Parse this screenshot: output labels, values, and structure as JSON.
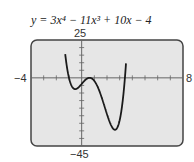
{
  "chart_data": {
    "type": "line",
    "title": "y = 3x⁴ − 11x³ + 10x − 4",
    "function": "3x^4 - 11x^3 + 10x - 4",
    "xlim": [
      -4,
      8
    ],
    "ylim": [
      -45,
      25
    ],
    "xlabel": "",
    "ylabel": "",
    "tick_labels": {
      "xmin": "−4",
      "xmax": "8",
      "ymax": "25",
      "ymin": "−45"
    },
    "x_tick_step": 1,
    "y_tick_step": 5,
    "grid": false,
    "series": [
      {
        "name": "y = 3x⁴ − 11x³ + 10x − 4",
        "x": [
          -1.0,
          -0.75,
          -0.5,
          -0.25,
          0,
          0.25,
          0.5,
          0.75,
          1.0,
          1.25,
          1.5,
          1.75,
          2.0,
          2.25,
          2.5,
          2.75,
          3.0,
          3.25
        ],
        "y": [
          0,
          -7.0,
          -7.8,
          -6.3,
          -4,
          -2.2,
          -1.2,
          -1.6,
          -2,
          -6.3,
          -12.4,
          -19.4,
          -24,
          -28.6,
          -26.2,
          -14.2,
          2,
          29.3
        ]
      }
    ],
    "colors": {
      "background": "#e6e6e6",
      "frame": "#444444",
      "curve": "#1a1a1a"
    }
  }
}
